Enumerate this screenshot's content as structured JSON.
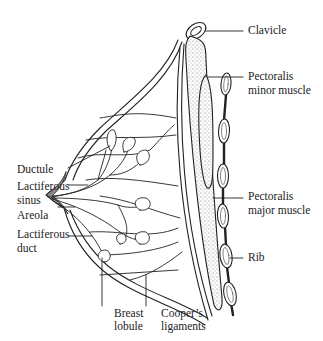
{
  "diagram": {
    "type": "anatomical-cross-section",
    "subject": "breast",
    "labels": {
      "clavicle": "Clavicle",
      "pectoralis_minor_1": "Pectoralis",
      "pectoralis_minor_2": "minor muscle",
      "pectoralis_major_1": "Pectoralis",
      "pectoralis_major_2": "major muscle",
      "rib": "Rib",
      "ductule": "Ductule",
      "lactiferous_sinus_1": "Lactiferous",
      "lactiferous_sinus_2": "sinus",
      "areola": "Areola",
      "lactiferous_duct_1": "Lactiferous",
      "lactiferous_duct_2": "duct",
      "breast_lobule_1": "Breast",
      "breast_lobule_2": "lobule",
      "coopers_1": "Cooper’s",
      "coopers_2": "ligaments"
    },
    "colors": {
      "line": "#222222",
      "stipple": "#9a9a9a",
      "areola_fill": "#8a8a8a",
      "background": "#ffffff"
    }
  }
}
